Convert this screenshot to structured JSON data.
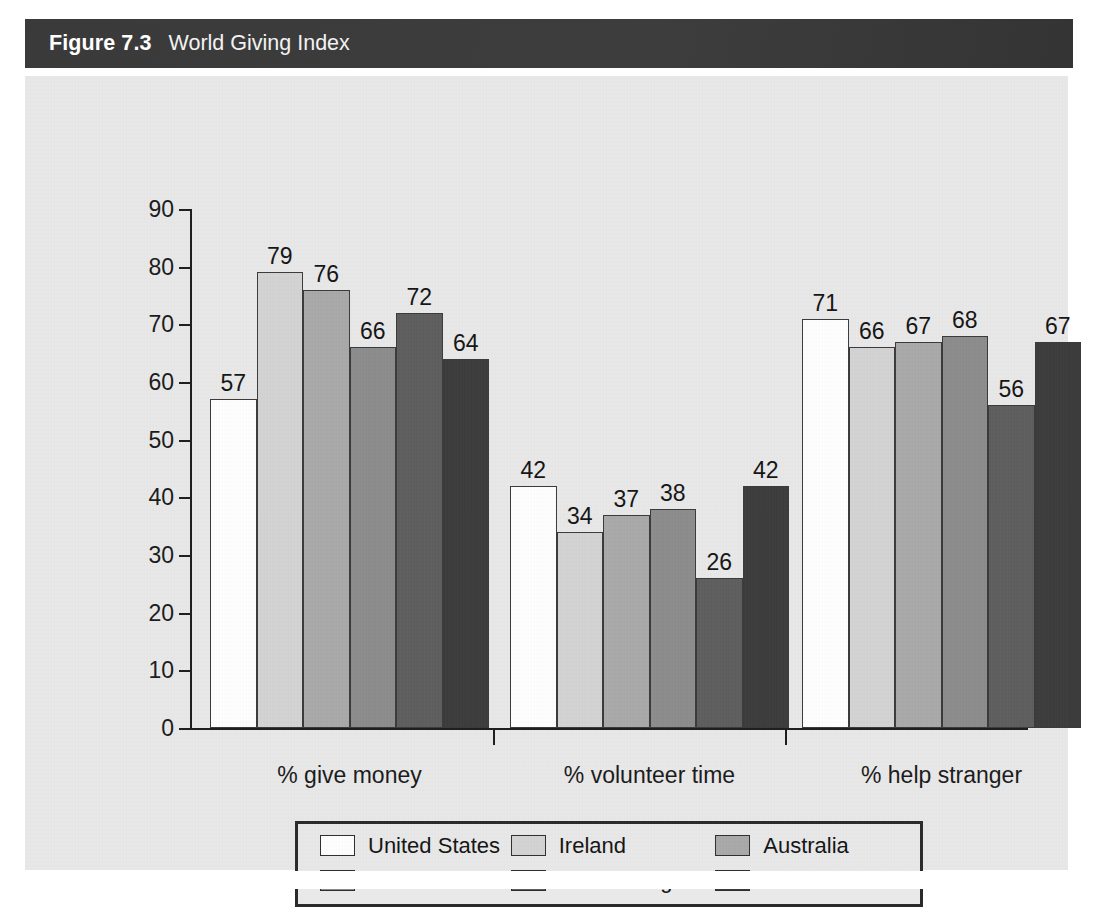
{
  "figure": {
    "number_label": "Figure 7.3",
    "title": "World Giving Index"
  },
  "colors": {
    "title_bar_bg": "#3b3b3b",
    "panel_bg": "#e9e9e9",
    "axis": "#1d1d1d",
    "series": [
      "#ffffff",
      "#d4d4d4",
      "#a9a9a9",
      "#8c8c8c",
      "#5e5e5e",
      "#3c3c3c"
    ]
  },
  "chart_data": {
    "type": "bar",
    "title": "World Giving Index",
    "xlabel": "",
    "ylabel": "",
    "ylim": [
      0,
      90
    ],
    "yticks": [
      0,
      10,
      20,
      30,
      40,
      50,
      60,
      70,
      80,
      90
    ],
    "ytick_labels": [
      "0",
      "10",
      "20",
      "30",
      "40",
      "50",
      "60",
      "70",
      "80",
      "90"
    ],
    "grid": false,
    "legend_position": "bottom",
    "categories": [
      "% give money",
      "% volunteer time",
      "% help stranger"
    ],
    "series": [
      {
        "name": "United States",
        "color": "#ffffff",
        "values": [
          57,
          42,
          71
        ]
      },
      {
        "name": "Ireland",
        "color": "#d4d4d4",
        "values": [
          79,
          34,
          66
        ]
      },
      {
        "name": "Australia",
        "color": "#a9a9a9",
        "values": [
          76,
          37,
          67
        ]
      },
      {
        "name": "New Zealand",
        "color": "#8c8c8c",
        "values": [
          66,
          38,
          68
        ]
      },
      {
        "name": "United Kingdom",
        "color": "#5e5e5e",
        "values": [
          72,
          26,
          56
        ]
      },
      {
        "name": "Canada",
        "color": "#3c3c3c",
        "values": [
          64,
          42,
          67
        ]
      }
    ]
  }
}
